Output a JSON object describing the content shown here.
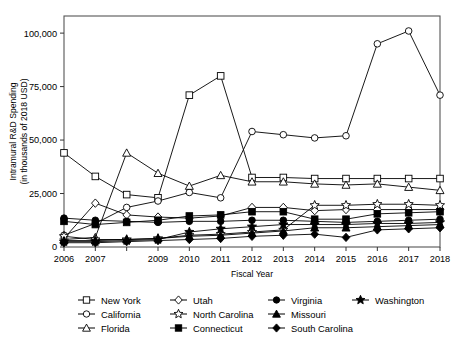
{
  "chart_data": {
    "type": "line",
    "title": "",
    "xlabel": "Fiscal Year",
    "ylabel": "Intramural R&D Spending\n(in thousands of 2018 USD)",
    "ylabel_line1": "Intramural R&D Spending",
    "ylabel_line2": "(in thousands of 2018 USD)",
    "categories": [
      2006,
      2007,
      2008,
      2009,
      2010,
      2011,
      2012,
      2013,
      2014,
      2015,
      2016,
      2017,
      2018
    ],
    "xtick_labels": [
      "2006",
      "2007",
      "",
      "2009",
      "2010",
      "2011",
      "2012",
      "2013",
      "2014",
      "2015",
      "2016",
      "2017",
      "2018"
    ],
    "ytick_values": [
      0,
      25000,
      50000,
      75000,
      100000
    ],
    "ytick_labels": [
      "0",
      "25,000",
      "50,000",
      "75,000",
      "100,000"
    ],
    "xlim": [
      2006,
      2018
    ],
    "ylim": [
      0,
      108000
    ],
    "grid": false,
    "legend_position": "bottom",
    "series": [
      {
        "name": "New York",
        "marker": "open-square",
        "values": [
          44000,
          33000,
          24500,
          23000,
          71000,
          80000,
          32500,
          32500,
          32000,
          32000,
          32000,
          32000,
          32000
        ]
      },
      {
        "name": "California",
        "marker": "open-circle",
        "values": [
          5500,
          11000,
          18500,
          21500,
          25500,
          23000,
          54000,
          52500,
          51000,
          52000,
          95000,
          101000,
          71000
        ]
      },
      {
        "name": "Florida",
        "marker": "open-triangle",
        "values": [
          3500,
          4500,
          44000,
          34500,
          28500,
          33500,
          30500,
          30500,
          29500,
          29000,
          29500,
          28000,
          26500
        ]
      },
      {
        "name": "Utah",
        "marker": "open-diamond",
        "values": [
          4000,
          20500,
          15000,
          14000,
          13500,
          14500,
          18500,
          18500,
          17000,
          17500,
          17500,
          17500,
          17500
        ]
      },
      {
        "name": "North Carolina",
        "marker": "open-star",
        "values": [
          5000,
          3500,
          3500,
          4000,
          5500,
          6000,
          7000,
          8000,
          19500,
          19500,
          20000,
          20000,
          19500
        ]
      },
      {
        "name": "Connecticut",
        "marker": "filled-square",
        "values": [
          12000,
          10500,
          11500,
          12500,
          14500,
          15000,
          16500,
          16500,
          13000,
          13000,
          15500,
          16000,
          16500
        ]
      },
      {
        "name": "Virginia",
        "marker": "filled-circle",
        "values": [
          13500,
          12500,
          12000,
          11500,
          12000,
          12000,
          12500,
          12500,
          12000,
          11500,
          12000,
          12500,
          13000
        ]
      },
      {
        "name": "Missouri",
        "marker": "filled-triangle",
        "values": [
          3000,
          3000,
          3500,
          4000,
          5000,
          5500,
          6500,
          7500,
          9000,
          9000,
          9500,
          10000,
          10500
        ]
      },
      {
        "name": "Washington",
        "marker": "filled-star",
        "values": [
          2500,
          2500,
          3000,
          3500,
          7000,
          8500,
          9500,
          10500,
          10500,
          10500,
          11000,
          11000,
          11500
        ]
      },
      {
        "name": "South Carolina",
        "marker": "filled-diamond",
        "values": [
          2000,
          2000,
          2500,
          3000,
          3500,
          4000,
          5000,
          5500,
          6000,
          4500,
          8000,
          8500,
          9000
        ]
      },
      {
        "name": "Missouri2",
        "marker": "none",
        "hidden": true,
        "values": [
          0,
          0,
          0,
          0,
          0,
          0,
          0,
          0,
          0,
          0,
          0,
          0,
          0
        ]
      }
    ],
    "legend": [
      {
        "label": "New York",
        "marker": "open-square"
      },
      {
        "label": "Utah",
        "marker": "open-diamond"
      },
      {
        "label": "Virginia",
        "marker": "filled-circle"
      },
      {
        "label": "Washington",
        "marker": "filled-star"
      },
      {
        "label": "California",
        "marker": "open-circle"
      },
      {
        "label": "North Carolina",
        "marker": "open-star"
      },
      {
        "label": "Missouri",
        "marker": "filled-triangle"
      },
      {
        "label": "Florida",
        "marker": "open-triangle"
      },
      {
        "label": "Connecticut",
        "marker": "filled-square"
      },
      {
        "label": "South Carolina",
        "marker": "filled-diamond"
      }
    ],
    "colors": {
      "line": "#000000",
      "axis": "#555555",
      "background": "#ffffff"
    }
  }
}
